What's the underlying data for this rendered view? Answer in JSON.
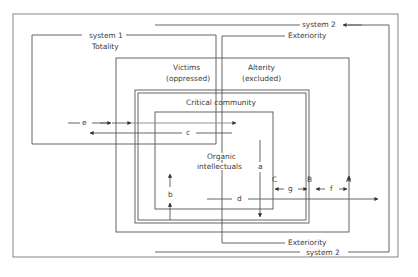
{
  "diagram": {
    "type": "nested-systems",
    "colors": {
      "line": "#555555",
      "text": "#3a3a3a",
      "background": "#ffffff"
    },
    "labels": {
      "system1": "system 1",
      "totality": "Totality",
      "system2_top": "system 2",
      "system2_bottom": "system 2",
      "exteriority_top": "Exteriority",
      "exteriority_bottom": "Exteriority",
      "victims": "Victims",
      "victims_sub": "(oppressed)",
      "alterity": "Alterity",
      "alterity_sub": "(excluded)",
      "critical_community": "Critical community",
      "organic": "Organic",
      "intellectuals": "intellectuals"
    },
    "arrows": {
      "a": "a",
      "b": "b",
      "c": "c",
      "d": "d",
      "e": "e",
      "f": "f",
      "g": "g"
    },
    "markers": {
      "A": "A",
      "B": "B",
      "C": "C"
    }
  }
}
